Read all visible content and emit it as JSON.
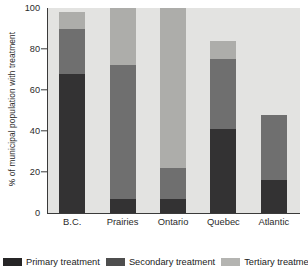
{
  "chart_data": {
    "type": "bar",
    "subtype": "stacked-bar",
    "title": "",
    "xlabel": "",
    "ylabel": "% of municipal population with treatment",
    "ylim": [
      0,
      100
    ],
    "yticks": [
      0,
      20,
      40,
      60,
      80,
      100
    ],
    "ytick_labels": [
      "0",
      "20",
      "40",
      "60",
      "80",
      "100"
    ],
    "grid": false,
    "legend_position": "bottom",
    "categories": [
      "B.C.",
      "Prairies",
      "Ontario",
      "Quebec",
      "Atlantic"
    ],
    "series": [
      {
        "name": "Primary treatment",
        "color": "#333233",
        "values": [
          68,
          7,
          7,
          41,
          16
        ]
      },
      {
        "name": "Secondary treatment",
        "color": "#6f6f6f",
        "values": [
          22,
          65,
          15,
          34,
          32
        ]
      },
      {
        "name": "Tertiary treatment",
        "color": "#adadaa",
        "values": [
          8,
          28,
          78,
          9,
          0
        ]
      }
    ],
    "totals": [
      98,
      100,
      100,
      84,
      48
    ]
  },
  "legend": {
    "items": [
      {
        "label": "Primary treatment",
        "swatch": "legend-swatch-primary"
      },
      {
        "label": "Secondary treatment",
        "swatch": "legend-swatch-secondary"
      },
      {
        "label": "Tertiary treatment",
        "swatch": "legend-swatch-tertiary"
      }
    ]
  }
}
